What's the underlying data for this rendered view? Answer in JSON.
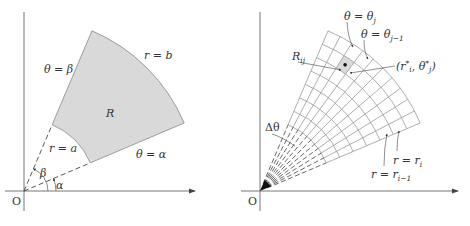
{
  "figure_left": {
    "origin_label": "O",
    "region_label": "R",
    "labels": {
      "theta_beta": "θ = β",
      "theta_alpha": "θ = α",
      "r_a": "r = a",
      "r_b": "r = b",
      "beta": "β",
      "alpha": "α"
    },
    "geometry": {
      "a": 72,
      "b": 174,
      "alpha_deg": 23,
      "beta_deg": 67
    },
    "colors": {
      "region_fill": "#d9d9d9",
      "stroke": "#555555"
    }
  },
  "figure_right": {
    "origin_label": "O",
    "labels": {
      "theta_j": "θ = θ",
      "theta_j_sub": "j",
      "theta_j1": "θ = θ",
      "theta_j1_sub": "j−1",
      "R_ij": "R",
      "R_ij_sub": "ij",
      "point": "(r*, θ*)",
      "point_full": "(r_i*, θ_j*)",
      "delta_theta": "Δθ",
      "r_i": "r = r",
      "r_i_sub": "i",
      "r_i1": "r = r",
      "r_i1_sub": "i−1"
    },
    "geometry": {
      "a": 72,
      "b": 174,
      "alpha_deg": 23,
      "beta_deg": 67,
      "radial_divisions": 7,
      "angular_divisions": 10
    },
    "colors": {
      "grid_stroke": "#9a9a9a",
      "cell_fill": "#d9d9d9"
    }
  }
}
